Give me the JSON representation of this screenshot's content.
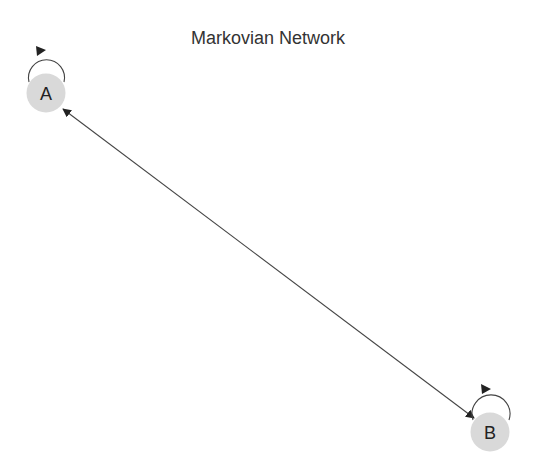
{
  "title": "Markovian Network",
  "colors": {
    "node_fill": "#d9d9d9",
    "edge": "#444444",
    "text": "#222222",
    "background": "#ffffff"
  },
  "nodes": [
    {
      "id": "A",
      "label": "A",
      "cx": 46,
      "cy": 93,
      "r": 19
    },
    {
      "id": "B",
      "label": "B",
      "cx": 490,
      "cy": 432,
      "r": 19
    }
  ],
  "edges": [
    {
      "from": "A",
      "to": "B",
      "directed": true,
      "bidirectional": true
    },
    {
      "from": "A",
      "to": "A",
      "self_loop": true
    },
    {
      "from": "B",
      "to": "B",
      "self_loop": true
    }
  ]
}
